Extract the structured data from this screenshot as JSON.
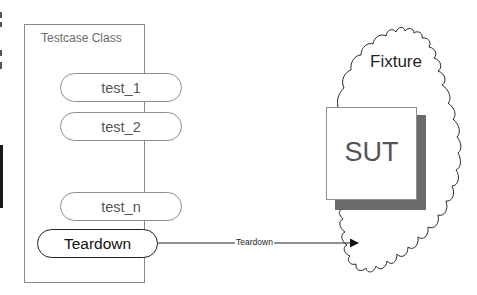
{
  "diagram": {
    "testcase_class": {
      "title": "Testcase Class",
      "methods": [
        {
          "label": "test_1"
        },
        {
          "label": "test_2"
        },
        {
          "label": "test_n"
        }
      ],
      "teardown": {
        "label": "Teardown"
      }
    },
    "fixture": {
      "label": "Fixture",
      "sut": {
        "label": "SUT"
      }
    },
    "connector": {
      "label": "Teardown",
      "from": "Teardown",
      "to": "Fixture"
    },
    "colors": {
      "sut_shadow": "#6b6b6b",
      "box_border": "#8a8a8a",
      "teardown_border": "#222222"
    }
  }
}
